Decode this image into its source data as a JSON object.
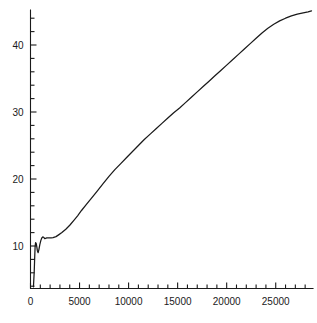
{
  "chart_data": {
    "type": "line",
    "title": "",
    "subtitle": "",
    "xlabel": "",
    "ylabel": "",
    "xlim": [
      0,
      28800
    ],
    "ylim": [
      3.5,
      46.5
    ],
    "grid": false,
    "legend": null,
    "legend_position": "none",
    "line_color": "#1a1a1a",
    "background_color": "#ffffff",
    "axis_color": "#1a1a1a",
    "x_ticks_major": [
      0,
      5000,
      10000,
      15000,
      20000,
      25000
    ],
    "x_tick_labels": [
      "0",
      "5000",
      "10000",
      "15000",
      "20000",
      "25000"
    ],
    "x_minor_tick_interval": 1000,
    "y_ticks_major": [
      10,
      20,
      30,
      40
    ],
    "y_tick_labels": [
      "10",
      "20",
      "30",
      "40"
    ],
    "y_minor_tick_interval": 2,
    "series": [
      {
        "name": "curve",
        "x": [
          300,
          380,
          430,
          470,
          520,
          580,
          640,
          700,
          780,
          860,
          950,
          1050,
          1150,
          1250,
          1350,
          1450,
          1550,
          1650,
          1750,
          1900,
          2100,
          2300,
          2600,
          2900,
          3200,
          3600,
          4000,
          4400,
          4800,
          5200,
          5700,
          6200,
          6800,
          7400,
          8000,
          8600,
          9200,
          9800,
          10400,
          11000,
          11600,
          12200,
          12800,
          13400,
          14000,
          14600,
          15200,
          15800,
          16400,
          17000,
          17600,
          18200,
          18800,
          19400,
          20000,
          20600,
          21200,
          21800,
          22400,
          23000,
          23600,
          24200,
          24800,
          25400,
          26000,
          26600,
          27200,
          27800,
          28300,
          28650
        ],
        "y": [
          3.9,
          6.2,
          8.4,
          9.9,
          10.5,
          10.4,
          9.9,
          9.3,
          9.0,
          9.5,
          10.2,
          10.8,
          11.2,
          11.35,
          11.3,
          11.1,
          11.15,
          11.2,
          11.2,
          11.2,
          11.2,
          11.25,
          11.4,
          11.7,
          12.0,
          12.5,
          13.1,
          13.8,
          14.5,
          15.3,
          16.2,
          17.1,
          18.2,
          19.3,
          20.4,
          21.4,
          22.3,
          23.2,
          24.1,
          25.0,
          25.9,
          26.7,
          27.5,
          28.3,
          29.1,
          29.9,
          30.6,
          31.4,
          32.2,
          33.0,
          33.8,
          34.6,
          35.4,
          36.2,
          37.0,
          37.8,
          38.6,
          39.4,
          40.2,
          41.0,
          41.8,
          42.5,
          43.1,
          43.6,
          44.0,
          44.35,
          44.6,
          44.8,
          44.95,
          45.1
        ]
      }
    ],
    "annotations": []
  }
}
